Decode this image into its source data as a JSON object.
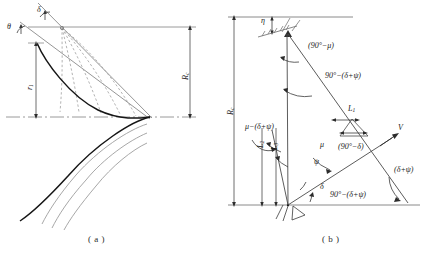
{
  "figure": {
    "type": "engineering-geometry-diagram",
    "panels": [
      {
        "id": "a",
        "caption": "( a )",
        "labels": {
          "theta": "θ",
          "delta": "δ",
          "r1_base": "r",
          "r1_sub": "1",
          "Rc_base": "R",
          "Rc_sub": "c"
        },
        "description_items": [
          "upper inclined straight line",
          "second parallel inclined straight line",
          "fan of dashed radial lines from origin point",
          "heavy curved trajectory",
          "three light parallel lower curves",
          "horizontal top reference line",
          "horizontal bottom chain-dot reference line",
          "vertical dimension r1 with double arrow",
          "vertical dimension Rc with double arrow"
        ]
      },
      {
        "id": "b",
        "caption": "( b )",
        "labels": {
          "eta": "η",
          "Rc_base": "R",
          "Rc_sub": "c",
          "L1_base": "L",
          "L1_sub": "1",
          "L2_base": "L",
          "L2_sub": "2",
          "L3_base": "L",
          "L3_sub": "3",
          "V": "V",
          "mu": "μ",
          "psi": "ψ",
          "delta": "δ",
          "ang_90_minus_mu": "(90°−μ)",
          "ang_90_minus_delta_psi_top": "90°−(δ+ψ)",
          "ang_mu_minus_delta_psi": "μ−(δ+ψ)",
          "ang_90_minus_delta": "(90°−δ)",
          "ang_90_minus_delta_psi_bottom": "90°−(δ+ψ)",
          "ang_delta_plus_psi": "(δ+ψ)"
        },
        "description_items": [
          "horizontal top reference line",
          "horizontal bottom ground line",
          "apex vertex with hatch marks",
          "vertical dimension Rc with double arrow",
          "dimension eta with double arrow",
          "ray V with arrow head",
          "angle arcs with arrow terminators"
        ]
      }
    ],
    "colors": {
      "ink": "#1a1a1a",
      "light_line": "#8f8f8f",
      "mid_line": "#5a5a5a",
      "paper": "#ffffff"
    }
  }
}
